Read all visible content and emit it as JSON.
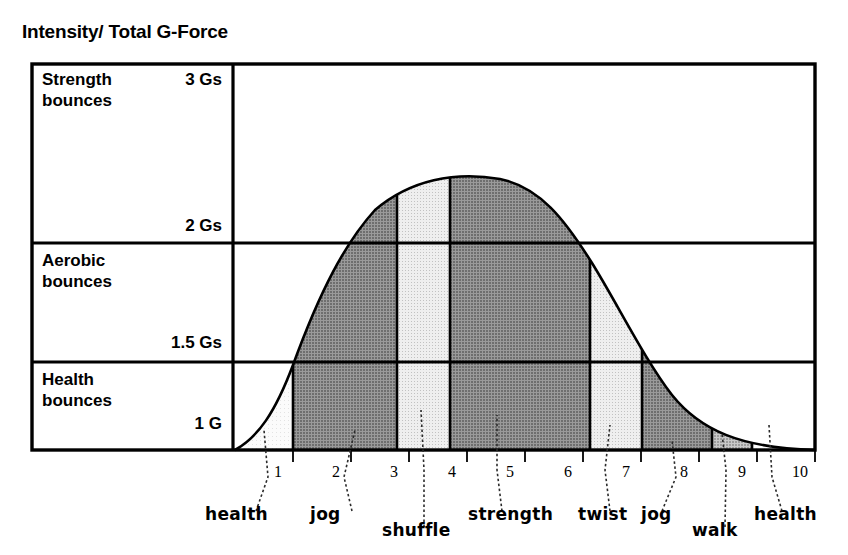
{
  "page": {
    "title": "Intensity/ Total G-Force"
  },
  "chart_data": {
    "type": "area",
    "title": "Intensity/ Total G-Force",
    "xlabel": "",
    "ylabel": "Intensity/ Total G-Force",
    "xlim": [
      0,
      10
    ],
    "ylim": [
      1,
      3
    ],
    "grid": true,
    "legend": "none",
    "y_bands": [
      {
        "name": "Strength bounces",
        "lower_label": "2 Gs",
        "upper_label": "3 Gs",
        "lower": 2,
        "upper": 3
      },
      {
        "name": "Aerobic bounces",
        "lower_label": "1.5 Gs",
        "upper_label": "2 Gs",
        "lower": 1.5,
        "upper": 2
      },
      {
        "name": "Health bounces",
        "lower_label": "1 G",
        "upper_label": "1.5 Gs",
        "lower": 1,
        "upper": 1.5
      }
    ],
    "y_tick_labels": [
      "3 Gs",
      "2 Gs",
      "1.5 Gs",
      "1 G"
    ],
    "x_tick_labels": [
      "1",
      "2",
      "3",
      "4",
      "5",
      "6",
      "7",
      "8",
      "9",
      "10"
    ],
    "x": [
      0,
      1,
      2,
      3,
      4,
      5,
      6,
      7,
      8,
      9,
      10
    ],
    "values": [
      1.0,
      1.38,
      1.74,
      2.11,
      2.44,
      2.6,
      2.48,
      2.1,
      1.68,
      1.26,
      1.0
    ],
    "annotations": [
      {
        "label": "health",
        "x": 1
      },
      {
        "label": "jog",
        "x": 2
      },
      {
        "label": "shuffle",
        "x": 3.3
      },
      {
        "label": "strength",
        "x": 5
      },
      {
        "label": "twist",
        "x": 6.5
      },
      {
        "label": "jog",
        "x": 7.6
      },
      {
        "label": "walk",
        "x": 8.6
      },
      {
        "label": "health",
        "x": 9.6
      }
    ],
    "segments": [
      {
        "label": "health",
        "from": 0.0,
        "to": 1.0,
        "shade": "white"
      },
      {
        "label": "jog",
        "from": 1.0,
        "to": 2.8,
        "shade": "dark"
      },
      {
        "label": "shuffle",
        "from": 2.8,
        "to": 3.7,
        "shade": "light"
      },
      {
        "label": "strength",
        "from": 3.7,
        "to": 6.1,
        "shade": "dark"
      },
      {
        "label": "twist",
        "from": 6.1,
        "to": 7.0,
        "shade": "light"
      },
      {
        "label": "jog",
        "from": 7.0,
        "to": 8.2,
        "shade": "dark"
      },
      {
        "label": "walk",
        "from": 8.2,
        "to": 8.9,
        "shade": "medium"
      },
      {
        "label": "health",
        "from": 8.9,
        "to": 10.0,
        "shade": "white"
      }
    ]
  },
  "colors": {
    "outline": "#000000",
    "fill_dark": "#7f7f7f",
    "fill_medium": "#a8a8a8",
    "fill_light": "#dcdcdc",
    "fill_white": "#f7f7f7",
    "background": "#ffffff"
  }
}
